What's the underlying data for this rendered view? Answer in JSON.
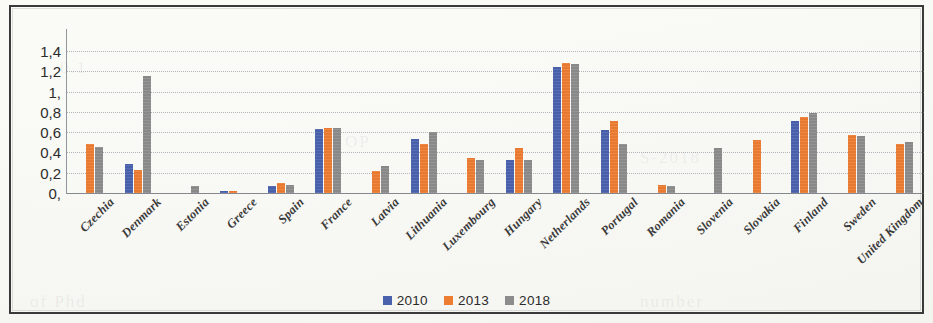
{
  "chart_data": {
    "type": "bar",
    "title": "",
    "subtitle": "",
    "xlabel": "",
    "ylabel": "",
    "ylim": [
      0,
      1.5
    ],
    "grid": true,
    "legend_position": "bottom",
    "decimal_separator": ",",
    "y_ticks": [
      "0,",
      "0,2",
      "0,4",
      "0,6",
      "0,8",
      "1,",
      "1,2",
      "1,4"
    ],
    "y_tick_values": [
      0,
      0.2,
      0.4,
      0.6,
      0.8,
      1.0,
      1.2,
      1.4
    ],
    "categories": [
      "Czechia",
      "Denmark",
      "Estonia",
      "Greece",
      "Spain",
      "France",
      "Latvia",
      "Lithuania",
      "Luxembourg",
      "Hungary",
      "Netherlands",
      "Portugal",
      "Romania",
      "Slovenia",
      "Slovakia",
      "Finland",
      "Sweden",
      "United Kingdom"
    ],
    "series": [
      {
        "name": "2010",
        "color": "#4a61ae",
        "values": [
          0,
          0.29,
          0,
          0.02,
          0.07,
          0.63,
          0,
          0.53,
          0,
          0.33,
          1.24,
          0.62,
          0,
          0,
          0,
          0.71,
          0,
          0
        ]
      },
      {
        "name": "2013",
        "color": "#ed7d31",
        "values": [
          0.48,
          0.23,
          0,
          0.02,
          0.1,
          0.64,
          0.22,
          0.48,
          0.35,
          0.44,
          1.28,
          0.71,
          0.08,
          0,
          0.52,
          0.75,
          0.57,
          0.48
        ]
      },
      {
        "name": "2018",
        "color": "#8c8c8c",
        "values": [
          0.45,
          1.15,
          0.07,
          0,
          0.08,
          0.64,
          0.27,
          0.6,
          0.33,
          0.33,
          1.27,
          0.48,
          0.07,
          0.44,
          0,
          0.79,
          0.56,
          0.5
        ]
      }
    ]
  },
  "legend": {
    "items": [
      {
        "label": "2010",
        "color": "#4a61ae"
      },
      {
        "label": "2013",
        "color": "#ed7d31"
      },
      {
        "label": "2018",
        "color": "#8c8c8c"
      }
    ]
  }
}
